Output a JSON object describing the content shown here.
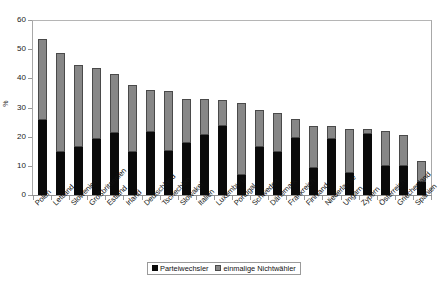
{
  "chart_data": {
    "type": "bar",
    "title": "",
    "subtitle": "",
    "xlabel": "",
    "ylabel": "%",
    "ylim": [
      0,
      60
    ],
    "yticks": [
      0,
      10,
      20,
      30,
      40,
      50,
      60
    ],
    "grid": false,
    "stacked": true,
    "legend_position": "bottom-center",
    "categories": [
      "Polen",
      "Lettland",
      "Slowenien",
      "Großbritannien",
      "Estland",
      "Irland",
      "Deutschland",
      "Tschechien",
      "Slowakei",
      "Italien",
      "Luxemburg",
      "Portugal",
      "Schweden",
      "Dänemark",
      "Frankreich",
      "Finnland",
      "Niederlande",
      "Ungarn",
      "Zypern",
      "Österreich",
      "Griechenland",
      "Spanien"
    ],
    "series": [
      {
        "name": "Parteiwechsler",
        "color": "#0a0a0a",
        "values": [
          25.7,
          14.9,
          16.5,
          19.2,
          21.3,
          14.7,
          21.6,
          15.2,
          17.9,
          20.5,
          23.6,
          7.0,
          16.3,
          14.6,
          19.5,
          9.1,
          19.2,
          7.6,
          21.0,
          10.0,
          10.1,
          4.6
        ]
      },
      {
        "name": "einmalige Nichtwähler",
        "color": "#878787",
        "values": [
          27.8,
          33.7,
          28.2,
          24.3,
          20.2,
          23.1,
          14.4,
          20.5,
          15.0,
          12.4,
          9.1,
          24.5,
          13.0,
          13.6,
          6.6,
          14.5,
          4.5,
          15.1,
          1.5,
          11.8,
          10.5,
          6.9
        ]
      }
    ],
    "totals": [
      53.5,
      48.6,
      44.7,
      43.5,
      41.5,
      37.8,
      36.0,
      35.7,
      32.9,
      32.9,
      32.7,
      31.5,
      29.3,
      28.2,
      26.1,
      23.6,
      23.7,
      22.7,
      22.5,
      21.8,
      20.6,
      11.5
    ]
  },
  "legend": {
    "items": [
      {
        "label": "Parteiwechsler",
        "swatch": "sw-black"
      },
      {
        "label": "einmalige Nichtwähler",
        "swatch": "sw-gray"
      }
    ]
  }
}
